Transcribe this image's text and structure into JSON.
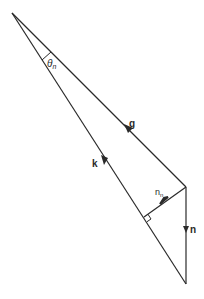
{
  "diagram": {
    "colors": {
      "line": "#2a2a2a",
      "background": "#ffffff"
    },
    "labels": {
      "theta": "θ",
      "theta_sub": "n",
      "g": "g",
      "k": "k",
      "n_n": "n",
      "n_n_sub": "n",
      "n": "n"
    },
    "vectors": [
      {
        "name": "g",
        "from": [
          12,
          13
        ],
        "to": [
          186,
          187
        ]
      },
      {
        "name": "k",
        "from": [
          12,
          13
        ],
        "to": [
          186,
          284
        ]
      },
      {
        "name": "n_n",
        "from": [
          186,
          187
        ],
        "to": [
          144,
          217
        ]
      },
      {
        "name": "n",
        "from": [
          186,
          187
        ],
        "to": [
          186,
          284
        ]
      }
    ],
    "right_angle_at": [
      144,
      217
    ]
  }
}
